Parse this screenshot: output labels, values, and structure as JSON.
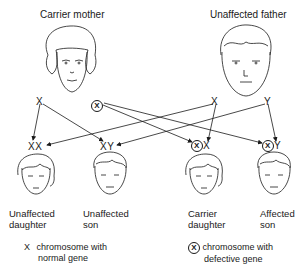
{
  "parents": {
    "mother": {
      "title": "Carrier mother",
      "chromosomes": [
        "X",
        "X"
      ]
    },
    "father": {
      "title": "Unaffected father",
      "chromosomes": [
        "X",
        "Y"
      ]
    }
  },
  "children": [
    {
      "chromosomes": "XX",
      "label_line1": "Unaffected",
      "label_line2": "daughter"
    },
    {
      "chromosomes": "XY",
      "label_line1": "Unaffected",
      "label_line2": "son"
    },
    {
      "chromosomes_circled": "X",
      "chromosomes_rest": "X",
      "label_line1": "Carrier",
      "label_line2": "daughter"
    },
    {
      "chromosomes_circled": "X",
      "chromosomes_rest": "Y",
      "label_line1": "Affected",
      "label_line2": "son"
    }
  ],
  "legend": {
    "normal": {
      "symbol": "X",
      "line1": "chromosome with",
      "line2": "normal gene"
    },
    "defective": {
      "symbol": "X",
      "line1": "chromosome with",
      "line2": "defective gene"
    }
  },
  "icons": {
    "mother_face": "woman-face-icon",
    "father_face": "man-face-icon",
    "child_faces": [
      "girl-face-icon",
      "boy-face-icon",
      "girl-face-icon",
      "boy-face-icon"
    ]
  }
}
